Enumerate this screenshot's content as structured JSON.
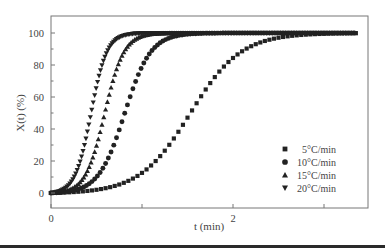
{
  "chart_data": {
    "type": "scatter",
    "title": "",
    "xlabel": "t (min)",
    "ylabel": "X(t) (%)",
    "xlim": [
      0,
      3.37
    ],
    "ylim": [
      -8,
      110
    ],
    "x_ticks": [
      0,
      1,
      2,
      3
    ],
    "x_tick_labels": [
      "0",
      "",
      "2",
      ""
    ],
    "y_ticks": [
      0,
      20,
      40,
      60,
      80,
      100
    ],
    "y_tick_labels": [
      "0",
      "20",
      "40",
      "60",
      "80",
      "100"
    ],
    "grid": false,
    "legend_position": "lower right",
    "series": [
      {
        "name": "5°C/min",
        "marker": "square",
        "midpoint_t": 1.53,
        "steepness": 3.6,
        "step": 0.05
      },
      {
        "name": "10°C/min",
        "marker": "circle",
        "midpoint_t": 0.81,
        "steepness": 7.0,
        "step": 0.03
      },
      {
        "name": "15°C/min",
        "marker": "triangle-up",
        "midpoint_t": 0.59,
        "steepness": 9.5,
        "step": 0.02
      },
      {
        "name": "20°C/min",
        "marker": "triangle-down",
        "midpoint_t": 0.44,
        "steepness": 11.5,
        "step": 0.016
      }
    ],
    "sample_points": {
      "5°C/min": {
        "t": [
          0,
          0.5,
          1.0,
          1.25,
          1.53,
          1.8,
          2.0,
          2.5,
          3.3
        ],
        "X": [
          0,
          2,
          13,
          27,
          50,
          73,
          84,
          97,
          100
        ]
      },
      "10°C/min": {
        "t": [
          0,
          0.4,
          0.6,
          0.81,
          1.0,
          1.2,
          1.5,
          2.0
        ],
        "X": [
          0,
          6,
          19,
          50,
          79,
          94,
          99,
          100
        ]
      },
      "15°C/min": {
        "t": [
          0,
          0.3,
          0.45,
          0.59,
          0.75,
          0.9,
          1.2
        ],
        "X": [
          0,
          6,
          21,
          50,
          82,
          95,
          100
        ]
      },
      "20°C/min": {
        "t": [
          0,
          0.2,
          0.33,
          0.44,
          0.56,
          0.7,
          1.0
        ],
        "X": [
          0,
          6,
          22,
          50,
          80,
          95,
          100
        ]
      }
    },
    "colors": {
      "markers": "#222222",
      "axis": "#555555",
      "text": "#444444"
    }
  }
}
